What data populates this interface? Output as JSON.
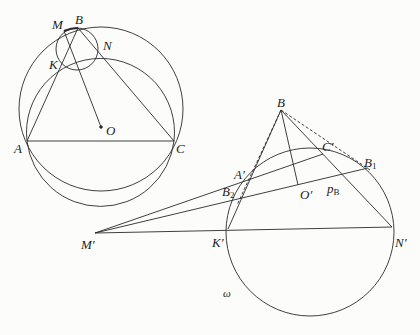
{
  "figure_left": {
    "points": {
      "A": {
        "label": "A",
        "x": 27,
        "y": 141
      },
      "B": {
        "label": "B",
        "x": 78,
        "y": 28
      },
      "C": {
        "label": "C",
        "x": 174,
        "y": 141
      },
      "M": {
        "label": "M",
        "x": 64,
        "y": 31
      },
      "N": {
        "label": "N",
        "x": 100,
        "y": 52
      },
      "K": {
        "label": "K",
        "x": 62,
        "y": 63
      },
      "O": {
        "label": "O",
        "x": 101,
        "y": 127
      }
    },
    "circles": [
      {
        "name": "circumcircle",
        "cx": 101,
        "cy": 109,
        "r": 82
      },
      {
        "name": "second-circle",
        "cx": 100,
        "cy": 121,
        "r": 74
      },
      {
        "name": "small-circle",
        "cx": 77,
        "cy": 49,
        "r": 21
      }
    ]
  },
  "figure_right": {
    "points": {
      "B": {
        "label": "B",
        "x": 281,
        "y": 110
      },
      "A_prime": {
        "label": "A′",
        "x": 249,
        "y": 178
      },
      "C_prime": {
        "label": "C′",
        "x": 323,
        "y": 154
      },
      "O_prime": {
        "label": "O′",
        "x": 298,
        "y": 185
      },
      "B1": {
        "label": "B",
        "sub": "1",
        "x": 368,
        "y": 168
      },
      "B2": {
        "label": "B",
        "sub": "2",
        "x": 240,
        "y": 192
      },
      "K_prime": {
        "label": "K′",
        "x": 228,
        "y": 229
      },
      "N_prime": {
        "label": "N′",
        "x": 392,
        "y": 227
      },
      "M_prime": {
        "label": "M′",
        "x": 95,
        "y": 233
      }
    },
    "circle_label": "ω",
    "p_label": "p",
    "p_sub": "B",
    "circles": [
      {
        "name": "omega-circle",
        "cx": 310,
        "cy": 232,
        "r": 84
      }
    ]
  },
  "colors": {
    "stroke": "#2a2a2a",
    "background": "#fcfcfa"
  }
}
